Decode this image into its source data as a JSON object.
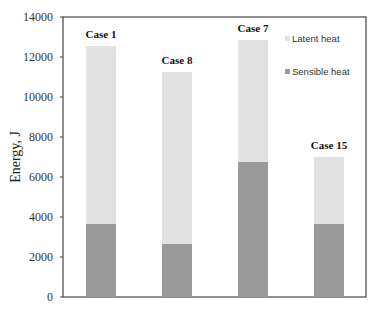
{
  "chart_data": {
    "type": "bar",
    "stacked": true,
    "title": "",
    "xlabel": "",
    "ylabel": "Energy, J",
    "ylim": [
      0,
      14000
    ],
    "yticks": [
      0,
      2000,
      4000,
      6000,
      8000,
      10000,
      12000,
      14000
    ],
    "grid": false,
    "legend_position": "upper right, inside",
    "categories": [
      "Case 1",
      "Case 8",
      "Case 7",
      "Case 15"
    ],
    "series": [
      {
        "name": "Sensible heat",
        "color": "#9a9a9a",
        "values": [
          3650,
          2650,
          6750,
          3650
        ]
      },
      {
        "name": "Latent heat",
        "color": "#e2e2e2",
        "values": [
          8900,
          8600,
          6100,
          3350
        ]
      }
    ],
    "totals": [
      12550,
      11250,
      12850,
      7000
    ],
    "annotations": [
      "Case 1",
      "Case 8",
      "Case 7",
      "Case 15"
    ]
  },
  "legend": {
    "items": [
      {
        "label": "Latent heat",
        "color": "#e2e2e2"
      },
      {
        "label": "Sensible heat",
        "color": "#9a9a9a"
      }
    ]
  },
  "axis": {
    "ylabel": "Energy, J",
    "ytick_labels": [
      "0",
      "2000",
      "4000",
      "6000",
      "8000",
      "10000",
      "12000",
      "14000"
    ]
  },
  "colors": {
    "frame": "#444444",
    "sensible": "#9a9a9a",
    "latent": "#e2e2e2"
  }
}
